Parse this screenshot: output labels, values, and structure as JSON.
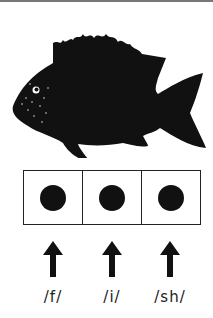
{
  "illustration": {
    "subject": "fish-silhouette",
    "color": "#111111"
  },
  "sound_boxes": {
    "count": 3,
    "dot_color": "#111111"
  },
  "phonemes": [
    {
      "label": "/f/"
    },
    {
      "label": "/i/"
    },
    {
      "label": "/sh/"
    }
  ],
  "icons": {
    "arrow": "arrow-up-icon"
  }
}
